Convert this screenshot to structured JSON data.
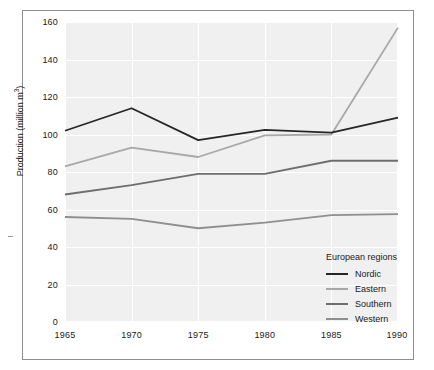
{
  "chart_data": {
    "type": "line",
    "title": "",
    "subtitle": "",
    "xlabel": "",
    "ylabel": "Production (million m3)",
    "ylabel_base": "Production (million m",
    "ylabel_sup": "3",
    "ylabel_close": ")",
    "x": [
      1965,
      1970,
      1975,
      1980,
      1985,
      1990
    ],
    "categories": [
      "1965",
      "1970",
      "1975",
      "1980",
      "1985",
      "1990"
    ],
    "xlim": [
      1965,
      1990
    ],
    "ylim": [
      0,
      160
    ],
    "yticks": [
      0,
      20,
      40,
      60,
      80,
      100,
      120,
      140,
      160
    ],
    "ytick_labels": [
      "0",
      "20",
      "40",
      "60",
      "80",
      "100",
      "120",
      "140",
      "160"
    ],
    "grid": true,
    "grid_color": "#ffffff",
    "plot_background": "#f0f0f0",
    "legend_position": "inside-lower-right",
    "legend_title": "European regions",
    "series": [
      {
        "name": "Nordic",
        "color": "#262626",
        "values": [
          102,
          114,
          97,
          102.5,
          101,
          109
        ]
      },
      {
        "name": "Eastern",
        "color": "#a8a8a8",
        "values": [
          83,
          93,
          88,
          99.5,
          100,
          157
        ]
      },
      {
        "name": "Southern",
        "color": "#6e6e6e",
        "values": [
          68,
          73,
          79,
          79,
          86,
          86
        ]
      },
      {
        "name": "Western",
        "color": "#8f8f8f",
        "values": [
          56,
          55,
          50,
          53,
          57,
          57.5
        ]
      }
    ]
  },
  "legend": {
    "title": "European regions",
    "entries": [
      {
        "label": "Nordic",
        "color": "#262626"
      },
      {
        "label": "Eastern",
        "color": "#a8a8a8"
      },
      {
        "label": "Southern",
        "color": "#6e6e6e"
      },
      {
        "label": "Western",
        "color": "#8f8f8f"
      }
    ]
  },
  "axes": {
    "y_label_text": "Production (million m",
    "y_label_exponent": "3",
    "y_label_suffix": ")",
    "y_tick_labels": [
      "160",
      "140",
      "120",
      "100",
      "80",
      "60",
      "40",
      "20",
      "0"
    ],
    "x_tick_labels": [
      "1965",
      "1970",
      "1975",
      "1980",
      "1985",
      "1990"
    ]
  },
  "colors": {
    "plot_bg": "#f0f0f0",
    "grid": "#ffffff",
    "frame": "#8e8e8e",
    "text": "#1a1a1a"
  }
}
